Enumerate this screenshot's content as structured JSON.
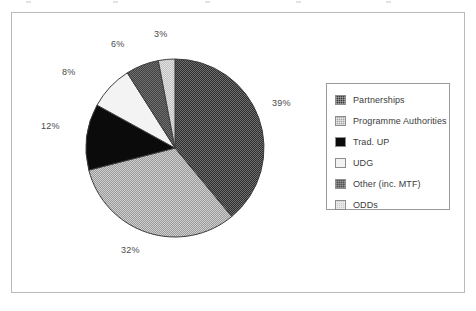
{
  "figure": {
    "background": "#ffffff",
    "frame_color": "#b9b9b9"
  },
  "chart_data": {
    "type": "pie",
    "title": "",
    "subtitle": "",
    "xlabel": "",
    "ylabel": "",
    "grid": false,
    "legend_position": "right",
    "start_angle_deg": 0,
    "direction": "clockwise",
    "units": "percent",
    "categories": [
      "Partnerships",
      "Programme Authorities",
      "Trad. UP",
      "UDG",
      "Other (inc. MTF)",
      "ODDs"
    ],
    "values": [
      39,
      32,
      12,
      8,
      6,
      3
    ],
    "data_labels": [
      "39%",
      "32%",
      "12%",
      "8%",
      "6%",
      "3%"
    ],
    "slice_colors": [
      "#3a3a3a",
      "#a6a6a6",
      "#0b0b0b",
      "#f2f2f2",
      "#4e4e4e",
      "#c9c9c9"
    ],
    "slice_patterns": [
      "dark-checker-dither",
      "mid-grey-dither",
      "solid-black",
      "solid-white",
      "dark-grey-dither",
      "light-grey-dither"
    ]
  },
  "pie": {
    "center_x": 175,
    "center_y": 148,
    "radius": 89,
    "outline_color": "#3d3d3d",
    "labels": [
      {
        "text": "39%",
        "x": 272,
        "y": 104
      },
      {
        "text": "32%",
        "x": 128,
        "y": 250
      },
      {
        "text": "12%",
        "x": 44,
        "y": 126
      },
      {
        "text": "8%",
        "x": 65,
        "y": 72
      },
      {
        "text": "6%",
        "x": 118,
        "y": 43
      },
      {
        "text": "3%",
        "x": 160,
        "y": 33
      }
    ]
  },
  "legend": {
    "border_color": "#9a9a9a",
    "items": [
      {
        "label": "Partnerships",
        "swatch": "dark-checker-dither"
      },
      {
        "label": "Programme Authorities",
        "swatch": "mid-grey-dither"
      },
      {
        "label": "Trad. UP",
        "swatch": "solid-black"
      },
      {
        "label": "UDG",
        "swatch": "solid-white"
      },
      {
        "label": "Other (inc. MTF)",
        "swatch": "dark-grey-dither"
      },
      {
        "label": "ODDs",
        "swatch": "light-grey-dither"
      }
    ]
  }
}
